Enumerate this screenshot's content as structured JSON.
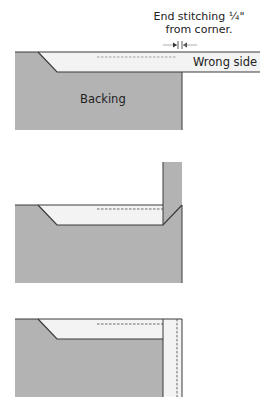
{
  "diagram": {
    "step1": {
      "caption_line1": "End stitching ¼\"",
      "caption_line2": "from corner.",
      "strip_label": "Wrong side",
      "backing_label": "Backing"
    },
    "step2": {},
    "step3": {}
  },
  "colors": {
    "backing": "#b3b3b3",
    "binding": "#f3f3f3",
    "line": "#3a3a3a",
    "text": "#222222"
  }
}
